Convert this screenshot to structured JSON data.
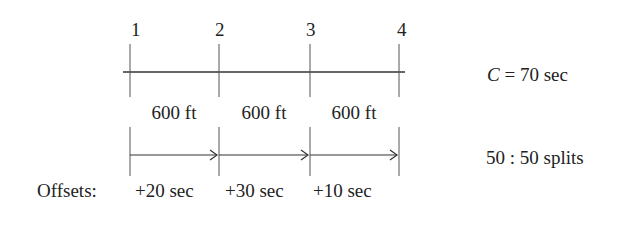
{
  "diagram": {
    "type": "signal-progression",
    "intersections": [
      {
        "label": "1",
        "x": 130
      },
      {
        "label": "2",
        "x": 219
      },
      {
        "label": "3",
        "x": 310
      },
      {
        "label": "4",
        "x": 399
      }
    ],
    "segments": [
      {
        "distance": "600 ft",
        "offset": "+20 sec"
      },
      {
        "distance": "600 ft",
        "offset": "+30 sec"
      },
      {
        "distance": "600 ft",
        "offset": "+10 sec"
      }
    ],
    "offsets_label": "Offsets:",
    "cycle": {
      "symbol": "C",
      "rest": " = 70 sec"
    },
    "splits": "50 : 50 splits",
    "line_color": "#333333"
  }
}
